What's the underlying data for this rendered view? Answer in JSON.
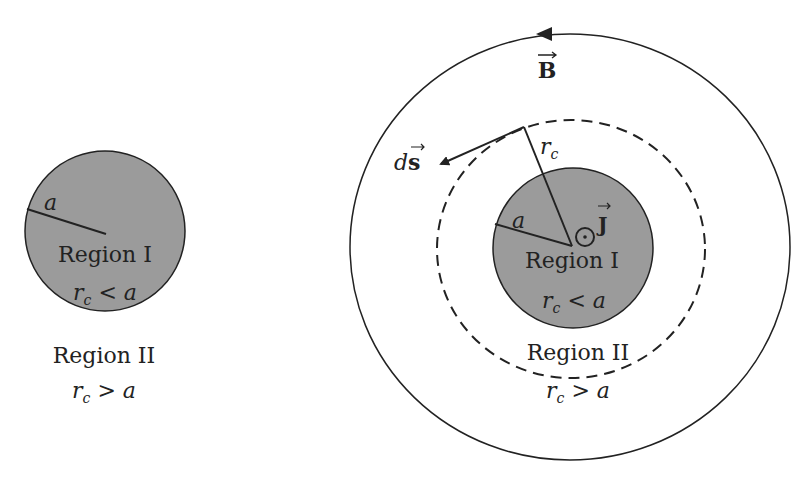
{
  "left_diagram": {
    "radius_label": "a",
    "region1_label": "Region I",
    "region1_cond": {
      "var": "r",
      "sub": "c",
      "op": " < ",
      "rhs": "a"
    },
    "region2_label": "Region II",
    "region2_cond": {
      "var": "r",
      "sub": "c",
      "op": " > ",
      "rhs": "a"
    }
  },
  "right_diagram": {
    "field_label": "B",
    "path_element_label_d": "d",
    "path_element_label_s": "s",
    "amperian_radius_label": {
      "var": "r",
      "sub": "c"
    },
    "radius_label": "a",
    "current_label": "J",
    "region1_label": "Region I",
    "region1_cond": {
      "var": "r",
      "sub": "c",
      "op": " < ",
      "rhs": "a"
    },
    "region2_label": "Region II",
    "region2_cond": {
      "var": "r",
      "sub": "c",
      "op": " > ",
      "rhs": "a"
    }
  },
  "colors": {
    "conductor_fill": "#9b9b9b",
    "stroke": "#222222",
    "text": "#222222"
  }
}
